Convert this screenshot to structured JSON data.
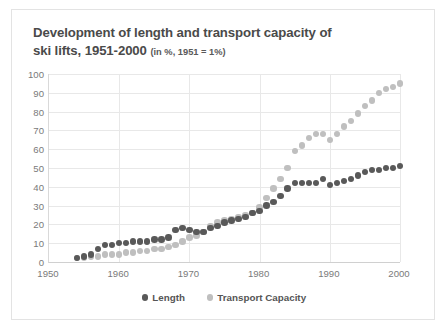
{
  "chart_title_main": "Development of length and transport capacity of ski lifts, 1951-2000",
  "chart_title_line1": "Development of length and transport capacity of",
  "chart_title_line2": "ski lifts, 1951-2000",
  "chart_subtitle": "(in %, 1951 = 1%)",
  "colors": {
    "length": "#595959",
    "transport_capacity": "#bfbfbf",
    "gridline": "#e8e8e8",
    "axis_text": "#7a7a7a",
    "title_text": "#4a4a4a",
    "card_border": "#e3e3e3",
    "background": "#ffffff"
  },
  "legend": {
    "position": "bottom-center",
    "items": [
      {
        "label": "Length",
        "color": "#595959"
      },
      {
        "label": "Transport Capacity",
        "color": "#bfbfbf"
      }
    ]
  },
  "chart_data": {
    "type": "scatter",
    "title": "Development of length and transport capacity of ski lifts, 1951-2000",
    "subtitle": "(in %, 1951 = 1%)",
    "xlabel": "",
    "ylabel": "",
    "xlim": [
      1950,
      2000
    ],
    "ylim": [
      0,
      100
    ],
    "xticks": [
      1950,
      1960,
      1970,
      1980,
      1990,
      2000
    ],
    "yticks": [
      0,
      10,
      20,
      30,
      40,
      50,
      60,
      70,
      80,
      90,
      100
    ],
    "grid": true,
    "x": [
      1954,
      1955,
      1956,
      1957,
      1958,
      1959,
      1960,
      1961,
      1962,
      1963,
      1964,
      1965,
      1966,
      1967,
      1968,
      1969,
      1970,
      1971,
      1972,
      1973,
      1974,
      1975,
      1976,
      1977,
      1978,
      1979,
      1980,
      1981,
      1982,
      1983,
      1984,
      1985,
      1986,
      1987,
      1988,
      1989,
      1990,
      1991,
      1992,
      1993,
      1994,
      1995,
      1996,
      1997,
      1998,
      1999,
      2000
    ],
    "series": [
      {
        "name": "Length",
        "color": "#595959",
        "values": [
          2,
          3,
          4,
          7,
          9,
          9,
          10,
          10,
          11,
          11,
          11,
          12,
          12,
          13,
          17,
          18,
          17,
          16,
          16,
          18,
          19,
          21,
          22,
          23,
          24,
          26,
          27,
          30,
          32,
          35,
          39,
          42,
          42,
          42,
          42,
          44,
          41,
          42,
          43,
          44,
          46,
          48,
          49,
          49,
          50,
          50,
          51
        ]
      },
      {
        "name": "Transport Capacity",
        "color": "#bfbfbf",
        "values": [
          2,
          2,
          3,
          3,
          4,
          4,
          4,
          5,
          5,
          6,
          6,
          7,
          7,
          8,
          9,
          11,
          13,
          14,
          16,
          19,
          21,
          22,
          23,
          24,
          25,
          26,
          29,
          34,
          39,
          44,
          50,
          59,
          62,
          66,
          68,
          68,
          65,
          68,
          72,
          75,
          79,
          83,
          86,
          90,
          92,
          93,
          95
        ]
      }
    ]
  }
}
